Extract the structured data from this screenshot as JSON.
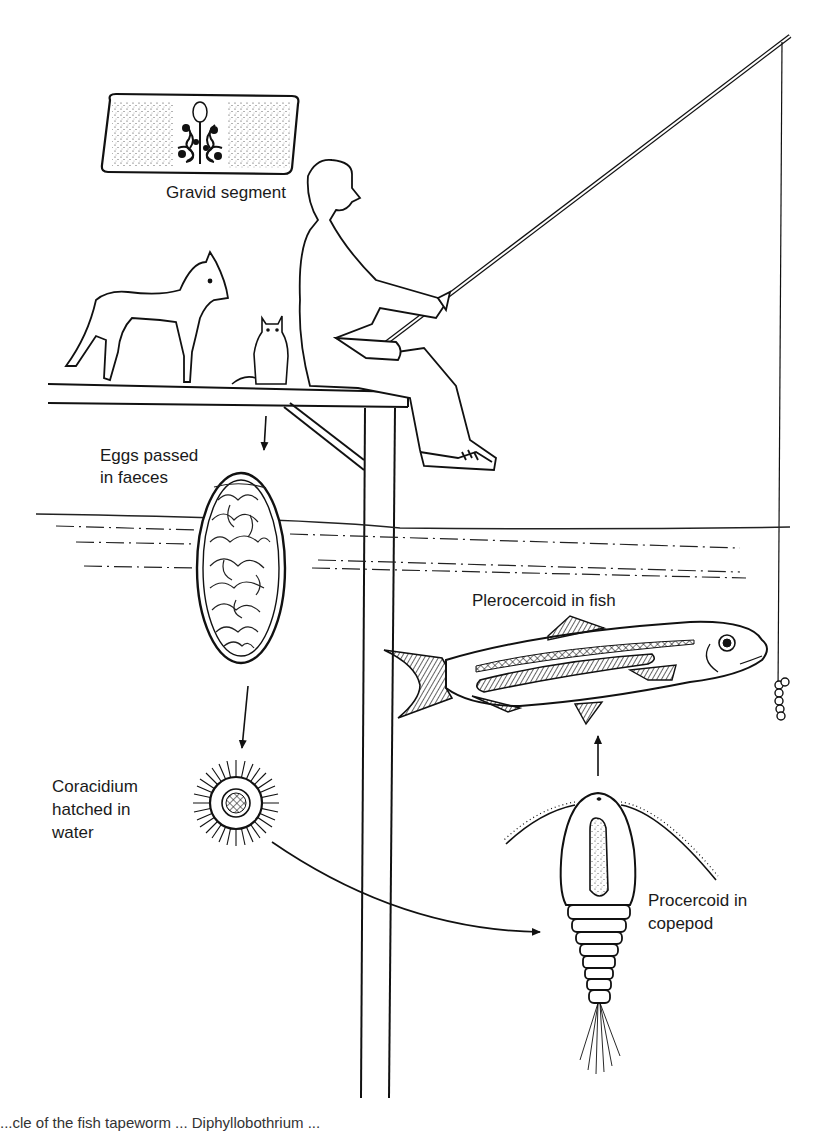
{
  "diagram": {
    "type": "life-cycle",
    "stages": [
      {
        "id": "gravid-segment",
        "label": "Gravid segment"
      },
      {
        "id": "eggs",
        "label_lines": [
          "Eggs passed",
          "in faeces"
        ]
      },
      {
        "id": "coracidium",
        "label_lines": [
          "Coracidium",
          "hatched in",
          "water"
        ]
      },
      {
        "id": "procercoid",
        "label_lines": [
          "Procercoid in",
          "copepod"
        ]
      },
      {
        "id": "plerocercoid",
        "label": "Plerocercoid in fish"
      }
    ],
    "hosts": [
      "dog",
      "cat",
      "human angler"
    ],
    "flow": [
      {
        "from": "hosts",
        "to": "eggs"
      },
      {
        "from": "eggs",
        "to": "coracidium"
      },
      {
        "from": "coracidium",
        "to": "procercoid"
      },
      {
        "from": "procercoid",
        "to": "plerocercoid"
      }
    ],
    "caption_partial": "...cle of the fish tapeworm ...   Diphyllobothrium ..."
  }
}
